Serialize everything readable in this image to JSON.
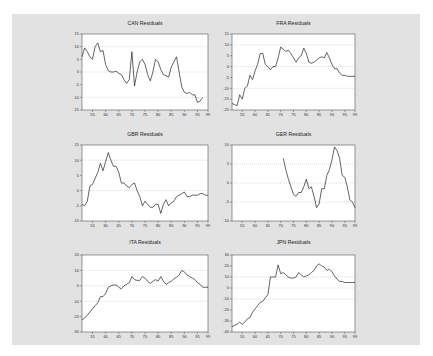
{
  "panel": {
    "background": "#e2e2e2"
  },
  "chart_data": [
    {
      "type": "line",
      "title": "CAN Residuals",
      "xlabel": "",
      "ylabel": "",
      "xlim": [
        1951,
        1999
      ],
      "ylim": [
        -15,
        15
      ],
      "yticks": [
        15,
        10,
        5,
        0,
        -5,
        -10,
        -15
      ],
      "ytick_labels": [
        "15",
        "10",
        "5",
        "0",
        "-5",
        "-10",
        "-15"
      ],
      "xticks": [
        55,
        60,
        65,
        70,
        75,
        80,
        85,
        90,
        95,
        99
      ],
      "xtick_labels": [
        "55",
        "60",
        "65",
        "70",
        "75",
        "80",
        "85",
        "90",
        "95",
        "99"
      ],
      "grid": {
        "dotted_y": [
          10,
          0,
          -10
        ]
      },
      "x": [
        51,
        52,
        53,
        54,
        55,
        56,
        57,
        58,
        59,
        60,
        61,
        62,
        63,
        64,
        65,
        66,
        67,
        68,
        69,
        70,
        71,
        72,
        73,
        74,
        75,
        76,
        77,
        78,
        79,
        80,
        81,
        82,
        83,
        84,
        85,
        86,
        87,
        88,
        89,
        90,
        91,
        92,
        93,
        94,
        95,
        96,
        97,
        98,
        99
      ],
      "values": [
        6,
        9.5,
        8,
        6,
        5,
        10,
        11.5,
        8,
        8.5,
        3,
        0.5,
        0,
        0,
        0.3,
        -0.5,
        -1,
        -3,
        -4.5,
        -3,
        8,
        -5.5,
        0,
        4,
        5,
        3,
        -1,
        -3.5,
        0,
        5,
        4,
        1,
        -1,
        -1.5,
        -2,
        2,
        4,
        6,
        0,
        -6,
        -8,
        -8.5,
        -8,
        -9,
        -9,
        -12,
        -11.5,
        -10
      ]
    },
    {
      "type": "line",
      "title": "FRA Residuals",
      "xlabel": "",
      "ylabel": "",
      "xlim": [
        1951,
        1999
      ],
      "ylim": [
        -20,
        15
      ],
      "yticks": [
        15,
        10,
        5,
        0,
        -5,
        -10,
        -15,
        -20
      ],
      "ytick_labels": [
        "15",
        "10",
        "5",
        "0",
        "-5",
        "-10",
        "-15",
        "-20"
      ],
      "xticks": [
        55,
        60,
        65,
        70,
        75,
        80,
        85,
        90,
        95,
        99
      ],
      "xtick_labels": [
        "55",
        "60",
        "65",
        "70",
        "75",
        "80",
        "85",
        "90",
        "95",
        "99"
      ],
      "grid": {
        "dotted_y": [
          10,
          0,
          -10
        ]
      },
      "x": [
        51,
        52,
        53,
        54,
        55,
        56,
        57,
        58,
        59,
        60,
        61,
        62,
        63,
        64,
        65,
        66,
        67,
        68,
        69,
        70,
        71,
        72,
        73,
        74,
        75,
        76,
        77,
        78,
        79,
        80,
        81,
        82,
        83,
        84,
        85,
        86,
        87,
        88,
        89,
        90,
        91,
        92,
        93,
        94,
        95,
        96,
        97,
        98,
        99
      ],
      "values": [
        -17,
        -17.5,
        -18,
        -13,
        -15,
        -10,
        -9,
        -4,
        -6,
        -2,
        1,
        6,
        6,
        1,
        0,
        -1.5,
        0,
        0,
        4,
        9,
        8,
        7,
        7.5,
        6,
        4,
        2,
        4,
        5,
        8.5,
        6,
        2,
        1.5,
        2,
        3,
        4,
        4.5,
        4,
        6.5,
        4,
        1,
        -1,
        -1,
        -3,
        -4,
        -4,
        -4.5,
        -4.5,
        -4.5,
        -4.5
      ]
    },
    {
      "type": "line",
      "title": "GBR Residuals",
      "xlabel": "",
      "ylabel": "",
      "xlim": [
        1951,
        1999
      ],
      "ylim": [
        -10,
        15
      ],
      "yticks": [
        15,
        10,
        5,
        0,
        -5,
        -10
      ],
      "ytick_labels": [
        "15",
        "10",
        "5",
        "0",
        "-5",
        "-10"
      ],
      "xticks": [
        55,
        60,
        65,
        70,
        75,
        80,
        85,
        90,
        95,
        99
      ],
      "xtick_labels": [
        "55",
        "60",
        "65",
        "70",
        "75",
        "80",
        "85",
        "90",
        "95",
        "99"
      ],
      "grid": {
        "dotted_y": [
          10,
          0
        ]
      },
      "x": [
        51,
        52,
        53,
        54,
        55,
        56,
        57,
        58,
        59,
        60,
        61,
        62,
        63,
        64,
        65,
        66,
        67,
        68,
        69,
        70,
        71,
        72,
        73,
        74,
        75,
        76,
        77,
        78,
        79,
        80,
        81,
        82,
        83,
        84,
        85,
        86,
        87,
        88,
        89,
        90,
        91,
        92,
        93,
        94,
        95,
        96,
        97,
        98,
        99
      ],
      "values": [
        -4.5,
        -5,
        -3.5,
        1.5,
        2,
        4,
        6,
        9,
        6.5,
        9.5,
        12.5,
        10,
        8,
        8,
        6,
        2.5,
        2.5,
        1.5,
        1,
        2,
        2.5,
        0,
        -2,
        -5,
        -3.5,
        -4.5,
        -5.5,
        -5.5,
        -4.5,
        -4.5,
        -7.5,
        -4.5,
        -3,
        -5,
        -4,
        -3.5,
        -2,
        -1.5,
        -1,
        -0.5,
        -2,
        -2,
        -1.5,
        -1.5,
        -1.5,
        -1,
        -1,
        -1.5,
        -1.5
      ]
    },
    {
      "type": "line",
      "title": "GER Residuals",
      "xlabel": "",
      "ylabel": "",
      "xlim": [
        1951,
        1999
      ],
      "ylim": [
        -10,
        10
      ],
      "yticks": [
        10,
        5,
        0,
        -5,
        -10
      ],
      "ytick_labels": [
        "10",
        "5",
        "0",
        "-5",
        "-10"
      ],
      "xticks": [
        55,
        60,
        65,
        70,
        75,
        80,
        85,
        90,
        95,
        99
      ],
      "xtick_labels": [
        "55",
        "60",
        "65",
        "70",
        "75",
        "80",
        "85",
        "90",
        "95",
        "99"
      ],
      "grid": {
        "dotted_y": [
          5,
          0,
          -5
        ]
      },
      "x": [
        71,
        72,
        73,
        74,
        75,
        76,
        77,
        78,
        79,
        80,
        81,
        82,
        83,
        84,
        85,
        86,
        87,
        88,
        89,
        90,
        91,
        92,
        93,
        94,
        95,
        96,
        97,
        98,
        99
      ],
      "values": [
        6.5,
        3.5,
        1,
        -1,
        -3,
        -3.5,
        -2.5,
        -2.5,
        -1,
        1,
        -1.5,
        -1,
        -3.5,
        -6.5,
        -5.5,
        -1.5,
        -1.5,
        2,
        3.5,
        6,
        9.5,
        8.5,
        6.5,
        2,
        1.5,
        -1,
        -4.5,
        -5,
        -6.5
      ]
    },
    {
      "type": "line",
      "title": "ITA Residuals",
      "xlabel": "",
      "ylabel": "",
      "xlim": [
        1951,
        1999
      ],
      "ylim": [
        -30,
        20
      ],
      "yticks": [
        20,
        10,
        0,
        -10,
        -20,
        -30
      ],
      "ytick_labels": [
        "20",
        "10",
        "0",
        "-10",
        "-20",
        "-30"
      ],
      "xticks": [
        55,
        60,
        65,
        70,
        75,
        80,
        85,
        90,
        95,
        99
      ],
      "xtick_labels": [
        "55",
        "60",
        "65",
        "70",
        "75",
        "80",
        "85",
        "90",
        "95",
        "99"
      ],
      "grid": {
        "dotted_y": [
          10,
          0,
          -10
        ]
      },
      "x": [
        51,
        52,
        53,
        54,
        55,
        56,
        57,
        58,
        59,
        60,
        61,
        62,
        63,
        64,
        65,
        66,
        67,
        68,
        69,
        70,
        71,
        72,
        73,
        74,
        75,
        76,
        77,
        78,
        79,
        80,
        81,
        82,
        83,
        84,
        85,
        86,
        87,
        88,
        89,
        90,
        91,
        92,
        93,
        94,
        95,
        96,
        97,
        98,
        99
      ],
      "values": [
        -22,
        -21,
        -19,
        -17,
        -15,
        -13,
        -11,
        -7,
        -7,
        -5,
        -1,
        0,
        0.5,
        0.5,
        -1,
        -2,
        0,
        1,
        2,
        6,
        4,
        3.5,
        3.5,
        6,
        5,
        3,
        1.5,
        3,
        4,
        3,
        6,
        3,
        1,
        2,
        3,
        4.5,
        5.5,
        7,
        10,
        9,
        7,
        6,
        5,
        4,
        2,
        1,
        -1,
        -1,
        -1
      ]
    },
    {
      "type": "line",
      "title": "JPN Residuals",
      "xlabel": "",
      "ylabel": "",
      "xlim": [
        1951,
        1999
      ],
      "ylim": [
        -40,
        30
      ],
      "yticks": [
        30,
        20,
        10,
        0,
        -10,
        -20,
        -30,
        -40
      ],
      "ytick_labels": [
        "30",
        "20",
        "10",
        "0",
        "-10",
        "-20",
        "-30",
        "-40"
      ],
      "xticks": [
        55,
        60,
        65,
        70,
        75,
        80,
        85,
        90,
        95,
        99
      ],
      "xtick_labels": [
        "55",
        "60",
        "65",
        "70",
        "75",
        "80",
        "85",
        "90",
        "95",
        "99"
      ],
      "grid": {
        "dotted_y": [
          10,
          0,
          -10
        ]
      },
      "x": [
        51,
        52,
        53,
        54,
        55,
        56,
        57,
        58,
        59,
        60,
        61,
        62,
        63,
        64,
        65,
        66,
        67,
        68,
        69,
        70,
        71,
        72,
        73,
        74,
        75,
        76,
        77,
        78,
        79,
        80,
        81,
        82,
        83,
        84,
        85,
        86,
        87,
        88,
        89,
        90,
        91,
        92,
        93,
        94,
        95,
        96,
        97,
        98,
        99
      ],
      "values": [
        -35,
        -34,
        -33,
        -31,
        -33,
        -31,
        -28,
        -27,
        -22,
        -19,
        -16,
        -13,
        -12,
        -9,
        -6,
        10,
        10,
        10,
        21,
        13,
        14,
        12,
        10,
        9,
        9,
        10,
        14,
        12,
        10,
        11,
        12,
        14,
        16,
        20,
        22,
        20,
        19,
        16,
        17,
        15,
        11,
        8,
        6,
        6,
        5,
        5,
        5,
        5,
        5
      ]
    }
  ]
}
